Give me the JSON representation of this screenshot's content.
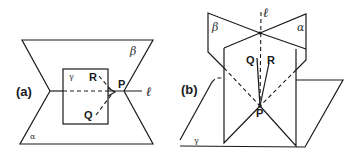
{
  "figure": {
    "panels": [
      {
        "id": "a",
        "label": "(a)",
        "planes": {
          "alpha": "α",
          "beta": "β",
          "gamma": "γ"
        },
        "line": "ℓ",
        "points": {
          "P": "P",
          "Q": "Q",
          "R": "R"
        }
      },
      {
        "id": "b",
        "label": "(b)",
        "planes": {
          "alpha": "α",
          "beta": "β",
          "gamma": "γ"
        },
        "line": "ℓ",
        "points": {
          "P": "P",
          "Q": "Q",
          "R": "R"
        }
      }
    ],
    "colors": {
      "ink": "#1a1a1a",
      "background": "#ffffff"
    }
  }
}
